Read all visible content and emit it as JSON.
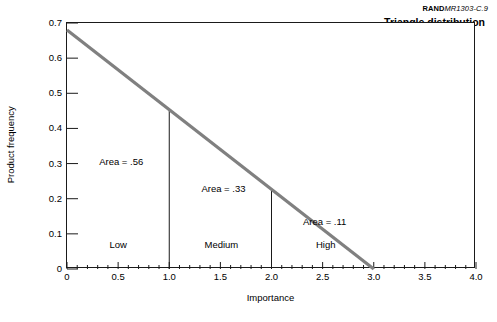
{
  "source_credit": {
    "bold_prefix": "RAND",
    "rest": "MR1303-C.9"
  },
  "chart_data": {
    "type": "line",
    "title": "Triangle distribution",
    "xlabel": "Importance",
    "ylabel": "Product frequency",
    "xlim": [
      0,
      4.0
    ],
    "ylim": [
      0,
      0.7
    ],
    "grid": false,
    "legend": "none",
    "line_color": "#808080",
    "x": [
      0,
      3.0
    ],
    "y": [
      0.68,
      0
    ],
    "series": [
      {
        "name": "Triangle distribution",
        "points": [
          {
            "x": 0,
            "y": 0.68
          },
          {
            "x": 3.0,
            "y": 0
          }
        ]
      }
    ],
    "xticks": [
      {
        "value": 0,
        "label": "0"
      },
      {
        "value": 0.5,
        "label": "0.5"
      },
      {
        "value": 1.0,
        "label": "1.0"
      },
      {
        "value": 1.5,
        "label": "1.5"
      },
      {
        "value": 2.0,
        "label": "2.0"
      },
      {
        "value": 2.5,
        "label": "2.5"
      },
      {
        "value": 3.0,
        "label": "3.0"
      },
      {
        "value": 3.5,
        "label": "3.5"
      },
      {
        "value": 4.0,
        "label": "4.0"
      }
    ],
    "xminor_step": 0.1,
    "yticks": [
      {
        "value": 0,
        "label": "0"
      },
      {
        "value": 0.1,
        "label": "0.1"
      },
      {
        "value": 0.2,
        "label": "0.2"
      },
      {
        "value": 0.3,
        "label": "0.3"
      },
      {
        "value": 0.4,
        "label": "0.4"
      },
      {
        "value": 0.5,
        "label": "0.5"
      },
      {
        "value": 0.6,
        "label": "0.6"
      },
      {
        "value": 0.7,
        "label": "0.7"
      }
    ],
    "dividers": [
      {
        "x": 1.0,
        "y_top": 0.4533
      },
      {
        "x": 2.0,
        "y_top": 0.2267
      }
    ],
    "regions": [
      {
        "name": "Low",
        "area": 0.56,
        "range": [
          0,
          1.0
        ],
        "area_label": "Area = .56",
        "label": "Low"
      },
      {
        "name": "Medium",
        "area": 0.33,
        "range": [
          1.0,
          2.0
        ],
        "area_label": "Area = .33",
        "label": "Medium"
      },
      {
        "name": "High",
        "area": 0.11,
        "range": [
          2.0,
          3.0
        ],
        "area_label": "Area = .11",
        "label": "High"
      }
    ],
    "annotations": [
      {
        "text": "Area = .56",
        "x": 0.53,
        "y": 0.305
      },
      {
        "text": "Area = .33",
        "x": 1.53,
        "y": 0.228
      },
      {
        "text": "Area = .11",
        "x": 2.52,
        "y": 0.135
      },
      {
        "text": "Low",
        "x": 0.5,
        "y": 0.067
      },
      {
        "text": "Medium",
        "x": 1.51,
        "y": 0.067
      },
      {
        "text": "High",
        "x": 2.53,
        "y": 0.067
      }
    ]
  }
}
